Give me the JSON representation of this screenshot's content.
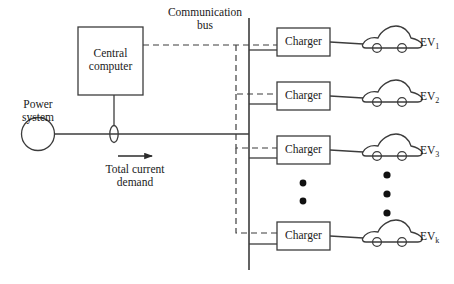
{
  "figure": {
    "type": "system-architecture-diagram",
    "stroke_color": "#3c3c3c",
    "text_color": "#1a1a1a",
    "background": "#ffffff"
  },
  "labels": {
    "power_system": "Power\nsystem",
    "central_computer": "Central\ncomputer",
    "communication_bus": "Communication\nbus",
    "total_current_demand": "Total current\ndemand"
  },
  "chargers": [
    {
      "label": "Charger"
    },
    {
      "label": "Charger"
    },
    {
      "label": "Charger"
    },
    {
      "label": "Charger"
    }
  ],
  "evs": [
    {
      "name": "EV",
      "subscript": "1"
    },
    {
      "name": "EV",
      "subscript": "2"
    },
    {
      "name": "EV",
      "subscript": "3"
    },
    {
      "name": "EV",
      "subscript": "k"
    }
  ],
  "ellipsis": {
    "charger_column_dots": 2,
    "ev_column_dots": 3
  }
}
